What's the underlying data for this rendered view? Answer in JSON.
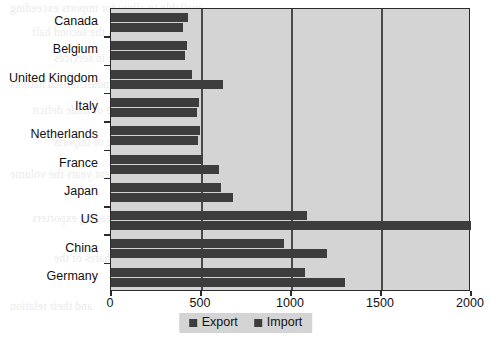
{
  "chart_data": {
    "type": "bar",
    "orientation": "horizontal",
    "title": "",
    "xlabel": "",
    "ylabel": "",
    "xlim": [
      0,
      2000
    ],
    "xticks": [
      0,
      500,
      1000,
      1500,
      2000
    ],
    "grid": true,
    "legend_position": "bottom-center",
    "categories": [
      "Canada",
      "Belgium",
      "United Kingdom",
      "Italy",
      "Netherlands",
      "France",
      "Japan",
      "US",
      "China",
      "Germany"
    ],
    "series": [
      {
        "name": "Import",
        "values": [
          430,
          420,
          450,
          490,
          495,
          510,
          610,
          1090,
          960,
          1080
        ]
      },
      {
        "name": "Export",
        "values": [
          400,
          410,
          620,
          480,
          485,
          600,
          680,
          2000,
          1200,
          1300
        ]
      }
    ],
    "colors": {
      "bar": "#3d3d3d",
      "plot_background": "#d4d4d4",
      "axis": "#2b2b2b",
      "gridline": "#4a4a4a",
      "page_background": "#ffffff"
    }
  },
  "legend": {
    "items": [
      {
        "label": "Export"
      },
      {
        "label": "Import"
      }
    ]
  },
  "axis": {
    "x_tick_labels": [
      "0",
      "500",
      "1000",
      "1500",
      "2000"
    ]
  },
  "background_text": {
    "lines": [
      "available to allow for imports exceeding",
      "in world trade in the second half",
      "from the trade in services",
      "of the industrialised nations",
      "the balance of trade deficit",
      "a growing share of imports",
      "in recent years the volume",
      "the leading exporters",
      "global shares of the",
      "and their relation"
    ]
  }
}
